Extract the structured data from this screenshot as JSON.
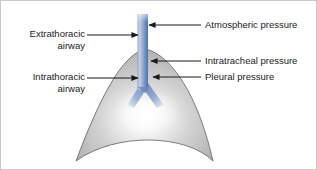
{
  "figure": {
    "background_color": "#ffffff",
    "border_color": "#c8c8c8"
  },
  "labels": {
    "extrathoracic_airway": "Extrathoracic\nairway",
    "intrathoracic_airway": "Intrathoracic\nairway",
    "atmospheric_pressure": "Atmospheric pressure",
    "intratracheal_pressure": "Intratracheal pressure",
    "pleural_pressure": "Pleural pressure"
  },
  "anatomy": {
    "lung_name": "lung-thorax-outline",
    "lung_fill_light": "#f2f2f2",
    "lung_fill_mid": "#c9c9c9",
    "lung_fill_dark": "#a8a8a8",
    "lung_stroke": "#6e6e6e",
    "airway_name": "trachea-and-bronchi",
    "airway_color_light": "#aebfe0",
    "airway_color_mid": "#6f8ec4",
    "airway_color_dark": "#4a6ba8"
  },
  "annotations": {
    "leader_color": "#1a1a1a",
    "items": [
      {
        "name": "extrathoracic-airway-pointer",
        "direction": "right",
        "target_x": 138,
        "y": 34
      },
      {
        "name": "intrathoracic-airway-pointer",
        "direction": "right",
        "target_x": 138,
        "y": 77
      },
      {
        "name": "atmospheric-pressure-pointer",
        "direction": "left",
        "target_x": 147,
        "y": 24
      },
      {
        "name": "intratracheal-pressure-pointer",
        "direction": "left",
        "target_x": 149,
        "y": 60
      },
      {
        "name": "pleural-pressure-pointer",
        "direction": "left",
        "target_x": 151,
        "y": 76
      }
    ]
  }
}
